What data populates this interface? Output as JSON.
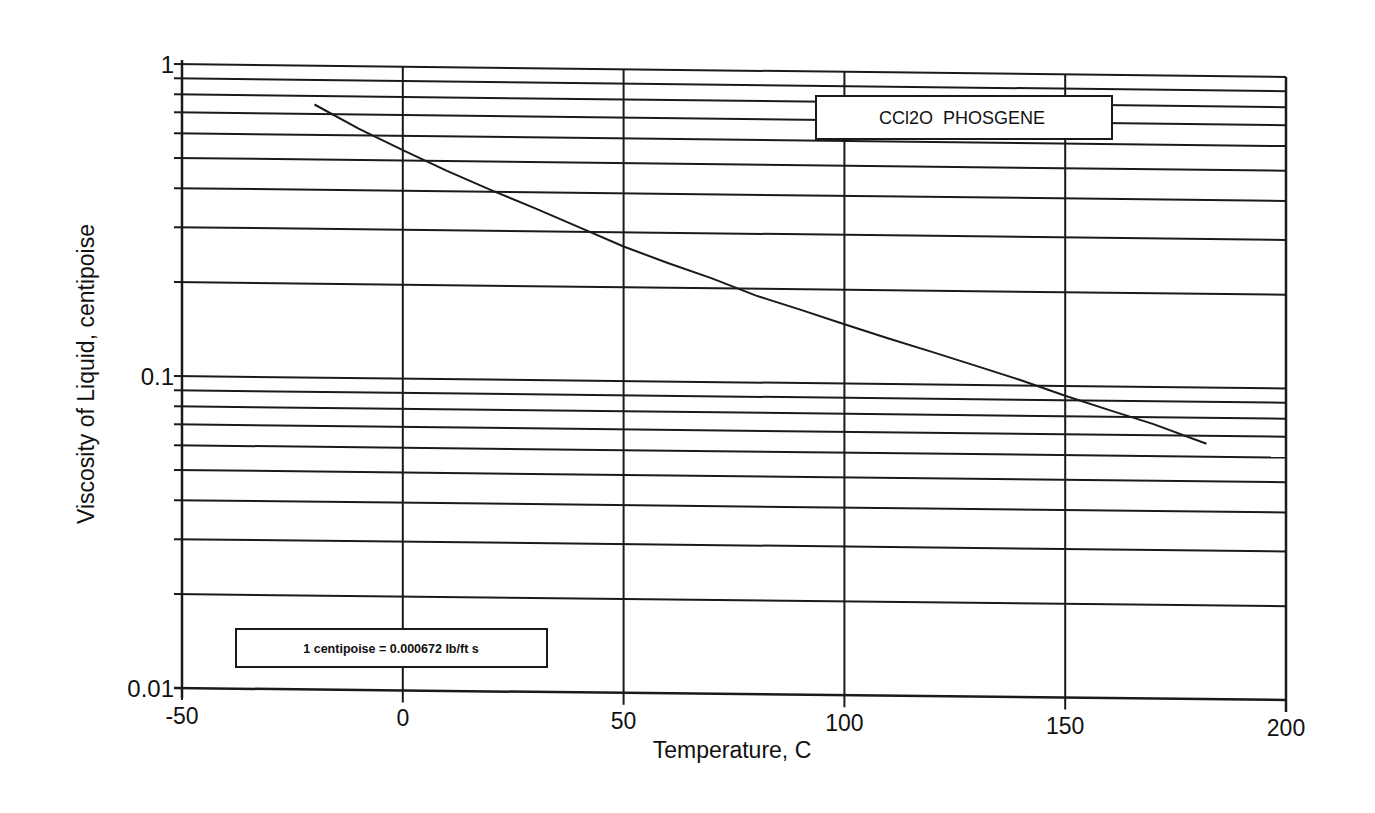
{
  "chart_data": {
    "type": "line",
    "title": "CCl2O  PHOSGENE",
    "xlabel": "Temperature, C",
    "ylabel": "Viscosity of Liquid, centipoise",
    "xlim": [
      -50,
      200
    ],
    "ylim": [
      0.01,
      1
    ],
    "yscale": "log",
    "grid": true,
    "x_ticks": [
      -50,
      0,
      50,
      100,
      150,
      200
    ],
    "x_tick_labels": [
      "-50",
      "0",
      "50",
      "100",
      "150",
      "200"
    ],
    "y_major_ticks": [
      0.01,
      0.1,
      1
    ],
    "y_tick_labels": [
      "0.01",
      "0.1",
      "1"
    ],
    "y_minor_gridlines": [
      0.02,
      0.03,
      0.04,
      0.05,
      0.06,
      0.07,
      0.08,
      0.09,
      0.2,
      0.3,
      0.4,
      0.5,
      0.6,
      0.7,
      0.8,
      0.9
    ],
    "annotations": [
      "CCl2O  PHOSGENE",
      "1 centipoise = 0.000672 lb/ft s"
    ],
    "legend": "none",
    "series": [
      {
        "name": "CCl2O PHOSGENE",
        "x": [
          -20,
          -10,
          0,
          10,
          20,
          30,
          40,
          50,
          60,
          70,
          80,
          90,
          100,
          110,
          120,
          130,
          140,
          150,
          160,
          170,
          182
        ],
        "values": [
          0.75,
          0.63,
          0.54,
          0.465,
          0.405,
          0.355,
          0.31,
          0.27,
          0.24,
          0.215,
          0.19,
          0.172,
          0.155,
          0.14,
          0.127,
          0.115,
          0.104,
          0.093,
          0.084,
          0.076,
          0.066
        ]
      }
    ]
  },
  "labels": {
    "title_box": "CCl2O  PHOSGENE",
    "note_box": "1 centipoise = 0.000672 lb/ft s",
    "xlabel": "Temperature, C",
    "ylabel": "Viscosity of Liquid, centipoise"
  }
}
